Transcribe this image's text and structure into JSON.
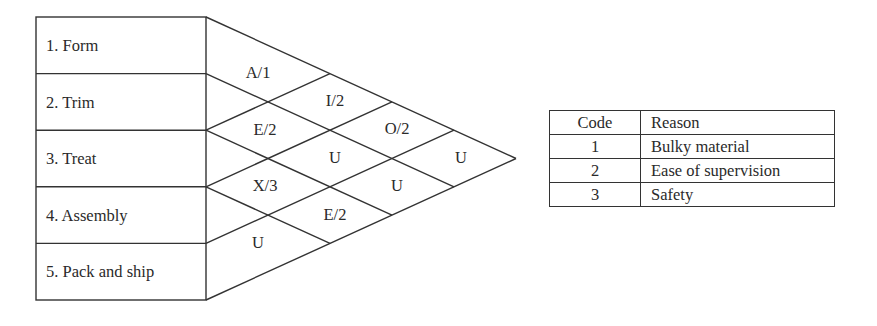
{
  "diagram": {
    "type": "relationship-chart",
    "departments": [
      {
        "label": "1. Form"
      },
      {
        "label": "2. Trim"
      },
      {
        "label": "3. Treat"
      },
      {
        "label": "4. Assembly"
      },
      {
        "label": "5. Pack and ship"
      }
    ],
    "relationships": [
      {
        "pair": "1-2",
        "value": "A/1"
      },
      {
        "pair": "1-3",
        "value": "I/2"
      },
      {
        "pair": "1-4",
        "value": "O/2"
      },
      {
        "pair": "1-5",
        "value": "U"
      },
      {
        "pair": "2-3",
        "value": "E/2"
      },
      {
        "pair": "2-4",
        "value": "U"
      },
      {
        "pair": "2-5",
        "value": "U"
      },
      {
        "pair": "3-4",
        "value": "X/3"
      },
      {
        "pair": "3-5",
        "value": "E/2"
      },
      {
        "pair": "4-5",
        "value": "U"
      }
    ]
  },
  "legend_table": {
    "headers": {
      "code": "Code",
      "reason": "Reason"
    },
    "rows": [
      {
        "code": "1",
        "reason": "Bulky material"
      },
      {
        "code": "2",
        "reason": "Ease of supervision"
      },
      {
        "code": "3",
        "reason": "Safety"
      }
    ]
  }
}
